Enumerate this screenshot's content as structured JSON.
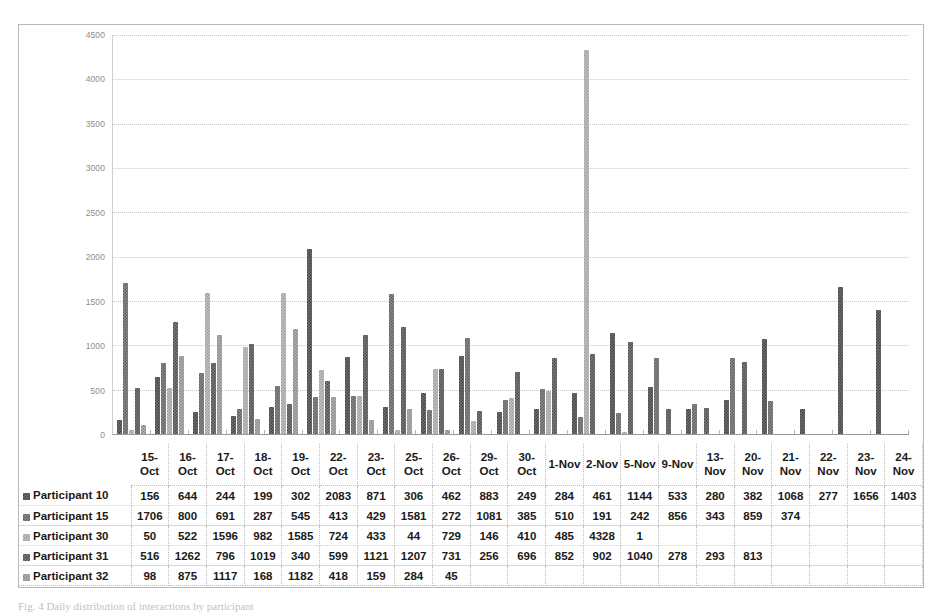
{
  "figure": {
    "caption": "Fig. 4 Daily distribution of interactions by participant"
  },
  "chart_data": {
    "type": "bar",
    "title": "",
    "xlabel": "",
    "ylabel": "",
    "ylim": [
      0,
      4500
    ],
    "yticks": [
      0,
      500,
      1000,
      1500,
      2000,
      2500,
      3000,
      3500,
      4000,
      4500
    ],
    "ytick_labels": [
      "0",
      "500",
      "1000",
      "1500",
      "2000",
      "2500",
      "3000",
      "3500",
      "4000",
      "4500"
    ],
    "grid": true,
    "legend_position": "data-table",
    "categories": [
      "15-Oct",
      "16-Oct",
      "17-Oct",
      "18-Oct",
      "19-Oct",
      "22-Oct",
      "23-Oct",
      "25-Oct",
      "26-Oct",
      "29-Oct",
      "30-Oct",
      "1-Nov",
      "2-Nov",
      "5-Nov",
      "9-Nov",
      "13-Nov",
      "20-Nov",
      "21-Nov",
      "22-Nov",
      "23-Nov",
      "24-Nov"
    ],
    "category_labels": [
      [
        "15-",
        "Oct"
      ],
      [
        "16-",
        "Oct"
      ],
      [
        "17-",
        "Oct"
      ],
      [
        "18-",
        "Oct"
      ],
      [
        "19-",
        "Oct"
      ],
      [
        "22-",
        "Oct"
      ],
      [
        "23-",
        "Oct"
      ],
      [
        "25-",
        "Oct"
      ],
      [
        "26-",
        "Oct"
      ],
      [
        "29-",
        "Oct"
      ],
      [
        "30-",
        "Oct"
      ],
      [
        "1-Nov",
        ""
      ],
      [
        "2-Nov",
        ""
      ],
      [
        "5-Nov",
        ""
      ],
      [
        "9-Nov",
        ""
      ],
      [
        "13-",
        "Nov"
      ],
      [
        "20-",
        "Nov"
      ],
      [
        "21-",
        "Nov"
      ],
      [
        "22-",
        "Nov"
      ],
      [
        "23-",
        "Nov"
      ],
      [
        "24-",
        "Nov"
      ]
    ],
    "series": [
      {
        "name": "Participant 10",
        "swatch": "#5e5e5e",
        "values": [
          156,
          644,
          244,
          199,
          302,
          2083,
          871,
          306,
          462,
          883,
          249,
          284,
          461,
          1144,
          533,
          280,
          382,
          1068,
          277,
          1656,
          1403
        ]
      },
      {
        "name": "Participant 15",
        "swatch": "#6e6e6e",
        "values": [
          1706,
          800,
          691,
          287,
          545,
          413,
          429,
          1581,
          272,
          1081,
          385,
          510,
          191,
          242,
          856,
          343,
          859,
          374,
          null,
          null,
          null
        ]
      },
      {
        "name": "Participant 30",
        "swatch": "#b5b5b5",
        "values": [
          50,
          522,
          1596,
          982,
          1585,
          724,
          433,
          44,
          729,
          146,
          410,
          485,
          4328,
          1,
          null,
          null,
          null,
          null,
          null,
          null,
          null
        ]
      },
      {
        "name": "Participant 31",
        "swatch": "#676767",
        "values": [
          516,
          1262,
          796,
          1019,
          340,
          599,
          1121,
          1207,
          731,
          256,
          696,
          852,
          902,
          1040,
          278,
          293,
          813,
          null,
          null,
          null,
          null
        ]
      },
      {
        "name": "Participant 32",
        "swatch": "#a8a8a8",
        "values": [
          98,
          875,
          1117,
          168,
          1182,
          418,
          159,
          284,
          45,
          null,
          null,
          null,
          null,
          null,
          null,
          null,
          null,
          null,
          null,
          null,
          null
        ]
      }
    ]
  }
}
